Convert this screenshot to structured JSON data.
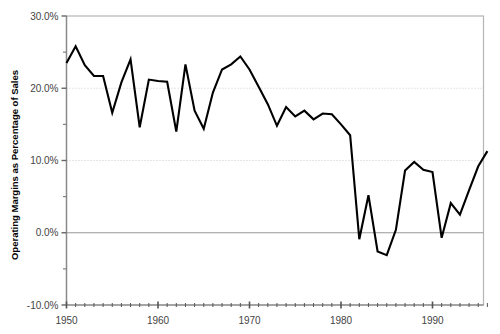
{
  "chart_data": {
    "type": "line",
    "title": "",
    "xlabel": "",
    "ylabel": "Operating Margins as Percentage of Sales",
    "xlim": [
      1949.5,
      1996.5
    ],
    "ylim": [
      -10.0,
      30.0
    ],
    "grid": true,
    "gridlines_y": [
      20.0,
      10.0
    ],
    "axis_line_y": [
      0.0,
      30.0
    ],
    "legend": null,
    "y_ticks_major": [
      "30.0%",
      "20.0%",
      "10.0%",
      "0.0%",
      "-10.0%"
    ],
    "y_tick_values": [
      30.0,
      20.0,
      10.0,
      0.0,
      -10.0
    ],
    "y_tick_minor_values": [
      25.0,
      15.0,
      5.0,
      -5.0
    ],
    "x_ticks_major": [
      "1950",
      "1960",
      "1970",
      "1980",
      "1990"
    ],
    "x_tick_values": [
      1950,
      1960,
      1970,
      1980,
      1990
    ],
    "x_tick_minor_step": 1,
    "series": [
      {
        "name": "Operating Margin",
        "color": "#000000",
        "x": [
          1950,
          1951,
          1952,
          1953,
          1954,
          1955,
          1956,
          1957,
          1958,
          1959,
          1960,
          1961,
          1962,
          1963,
          1964,
          1965,
          1966,
          1967,
          1968,
          1969,
          1970,
          1971,
          1972,
          1973,
          1974,
          1975,
          1976,
          1977,
          1978,
          1979,
          1980,
          1981,
          1982,
          1983,
          1984,
          1985,
          1986,
          1987,
          1988,
          1989,
          1990,
          1991,
          1992,
          1993,
          1994,
          1995,
          1996
        ],
        "values": [
          23.5,
          25.8,
          23.2,
          21.7,
          21.7,
          16.6,
          20.8,
          24.0,
          14.6,
          21.2,
          21.0,
          20.9,
          14.0,
          23.3,
          16.9,
          14.4,
          19.4,
          22.6,
          23.3,
          24.4,
          22.6,
          20.2,
          17.8,
          14.8,
          17.4,
          16.1,
          16.9,
          15.7,
          16.5,
          16.4,
          15.0,
          13.5,
          -0.9,
          5.2,
          -2.6,
          -3.1,
          0.4,
          8.6,
          9.8,
          8.7,
          8.4,
          -0.7,
          4.1,
          2.5,
          5.9,
          9.2,
          11.3
        ]
      }
    ]
  },
  "axes": {
    "y_label": "Operating Margins as Percentage of Sales"
  },
  "colors": {
    "line": "#000000",
    "frame": "#b5b5b5",
    "gridline": "#cccccc",
    "zero_line": "#999999",
    "tick": "#666666",
    "text": "#333333"
  }
}
